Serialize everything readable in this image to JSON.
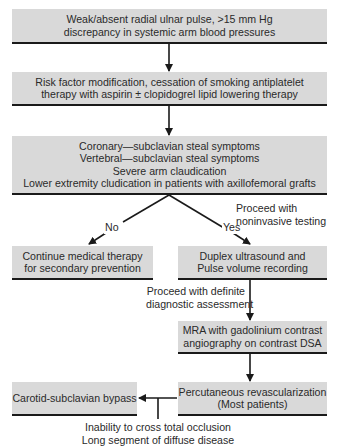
{
  "flowchart": {
    "nodes": {
      "presentation": {
        "lines": [
          "Weak/absent radial ulnar pulse, >15 mm Hg",
          "discrepancy in systemic arm blood pressures"
        ]
      },
      "risk_modification": {
        "lines": [
          "Risk factor modification, cessation of smoking antiplatelet",
          "therapy with aspirin ± clopidogrel lipid lowering therapy"
        ]
      },
      "symptoms": {
        "lines": [
          "Coronary—subclavian steal symptoms",
          "Vertebral—subclavian steal symptoms",
          "Severe arm claudication",
          "Lower extremity cludication in patients with axillofemoral grafts"
        ]
      },
      "continue_therapy": {
        "lines": [
          "Continue medical therapy",
          "for secondary prevention"
        ]
      },
      "duplex": {
        "lines": [
          "Duplex ultrasound and",
          "Pulse volume recording"
        ]
      },
      "mra": {
        "lines": [
          "MRA with gadolinium contrast",
          "angiography on contrast DSA"
        ]
      },
      "percutaneous": {
        "lines": [
          "Percutaneous revascularization",
          "(Most patients)"
        ]
      },
      "bypass": {
        "lines": [
          "Carotid-subclavian bypass"
        ]
      }
    },
    "edge_labels": {
      "no": "No",
      "yes": "Yes",
      "noninvasive": [
        "Proceed with",
        "noninvasive testing"
      ],
      "definite": [
        "Proceed with definite",
        "diagnostic assessment"
      ],
      "bypass_reason": [
        "Inability to cross total occlusion",
        "Long segment of diffuse disease"
      ]
    },
    "colors": {
      "box_fill": "#d9d9d9",
      "line": "#1a1a1a"
    }
  }
}
